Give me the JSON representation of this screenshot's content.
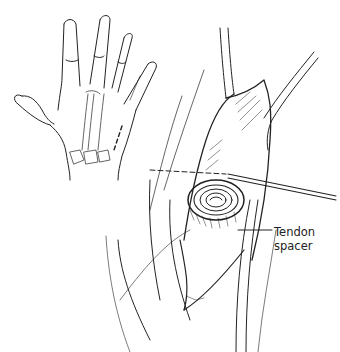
{
  "figure": {
    "type": "surgical line illustration",
    "panels": [
      {
        "name": "hand-inset",
        "description": "dorsal view of hand with skeletal overlay and dashed incision line"
      },
      {
        "name": "operative-field",
        "description": "exposed surgical site with retractors, pin, and coiled tendon spacer"
      }
    ],
    "label": {
      "line1": "Tendon",
      "line2": "spacer"
    },
    "colors": {
      "ink": "#222222",
      "background": "#ffffff"
    }
  }
}
